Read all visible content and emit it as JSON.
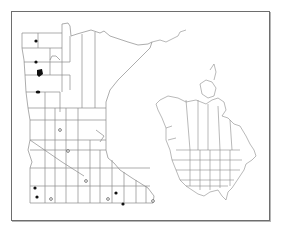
{
  "map": {
    "title": "Distribution map",
    "main_region": "Minnesota (county outlines)",
    "inset_region": "North America (states and provinces)",
    "frame_color": "#6e6e6e",
    "line_color": "#8a8a8a",
    "marker_color": "#111111",
    "legend": {
      "filled": "Filled circle",
      "open": "Open circle"
    },
    "markers": {
      "filled": [
        [
          36,
          41
        ],
        [
          36,
          62
        ],
        [
          40,
          72
        ],
        [
          38,
          92
        ],
        [
          35,
          188
        ],
        [
          37,
          197
        ],
        [
          116,
          193
        ],
        [
          123,
          204
        ]
      ],
      "open": [
        [
          60,
          130
        ],
        [
          68,
          151
        ],
        [
          86,
          181
        ],
        [
          51,
          199
        ],
        [
          108,
          199
        ],
        [
          153,
          201
        ]
      ]
    }
  }
}
